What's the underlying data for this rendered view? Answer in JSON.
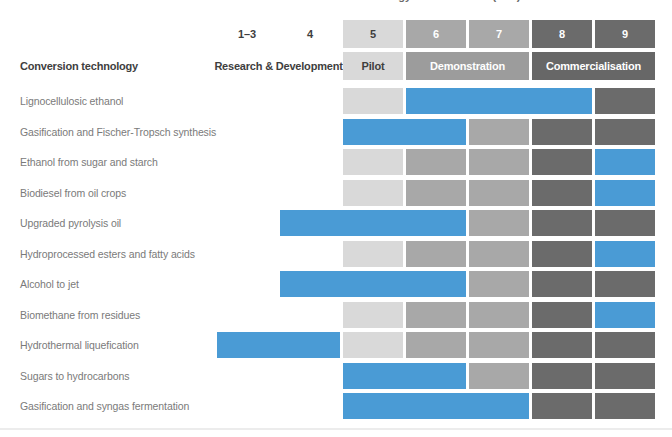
{
  "chart_data": {
    "type": "heatmap",
    "title": "Technology readiness level (TRL)",
    "row_header": "Conversion technology",
    "columns": [
      {
        "label": "1–3",
        "stage": "rd"
      },
      {
        "label": "4",
        "stage": "rd"
      },
      {
        "label": "5",
        "stage": "pilot"
      },
      {
        "label": "6",
        "stage": "demo"
      },
      {
        "label": "7",
        "stage": "demo"
      },
      {
        "label": "8",
        "stage": "comm"
      },
      {
        "label": "9",
        "stage": "comm"
      }
    ],
    "stage_headers": [
      {
        "label": "Research & Development",
        "style": "rd",
        "col_start": 0,
        "col_end": 1
      },
      {
        "label": "Pilot",
        "style": "pilot",
        "col_start": 2,
        "col_end": 2
      },
      {
        "label": "Demonstration",
        "style": "demo",
        "col_start": 3,
        "col_end": 4
      },
      {
        "label": "Commercialisation",
        "style": "comm",
        "col_start": 5,
        "col_end": 6
      }
    ],
    "rows": [
      {
        "label": "Lignocellulosic ethanol",
        "trl_range": [
          "6",
          "8"
        ]
      },
      {
        "label": "Gasification and Fischer-Tropsch synthesis",
        "trl_range": [
          "5",
          "6"
        ]
      },
      {
        "label": "Ethanol from sugar and starch",
        "trl_range": [
          "9",
          "9"
        ]
      },
      {
        "label": "Biodiesel from oil crops",
        "trl_range": [
          "9",
          "9"
        ]
      },
      {
        "label": "Upgraded pyrolysis oil",
        "trl_range": [
          "4",
          "6"
        ]
      },
      {
        "label": "Hydroprocessed esters and fatty acids",
        "trl_range": [
          "9",
          "9"
        ]
      },
      {
        "label": "Alcohol to jet",
        "trl_range": [
          "4",
          "6"
        ]
      },
      {
        "label": "Biomethane from residues",
        "trl_range": [
          "9",
          "9"
        ]
      },
      {
        "label": "Hydrothermal liquefication",
        "trl_range": [
          "1–3",
          "4"
        ]
      },
      {
        "label": "Sugars to hydrocarbons",
        "trl_range": [
          "5",
          "6"
        ]
      },
      {
        "label": "Gasification and syngas fermentation",
        "trl_range": [
          "5",
          "7"
        ]
      }
    ],
    "colors": {
      "highlight_blue": "#4a9bd5",
      "pilot_bg": "#d9d9d9",
      "demo_bg": "#a8a8a8",
      "comm_bg": "#6b6b6b",
      "demo_header_bg": "#9c9c9c",
      "comm_header_bg": "#676767",
      "dark_text": "#3e3e3e",
      "row_label_text": "#7a7a7a"
    }
  }
}
